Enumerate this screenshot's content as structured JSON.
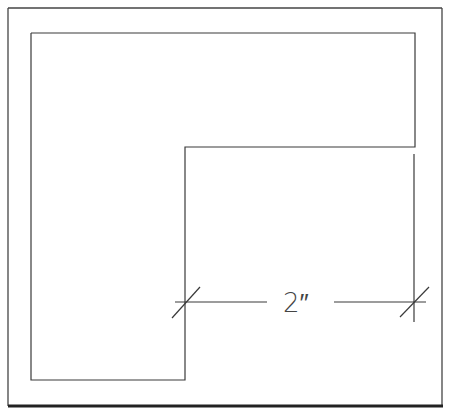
{
  "drawing": {
    "type": "CAD dimension drawing",
    "shape": "L-shaped outline",
    "dimension_label": "2″",
    "dimension_units": "inches",
    "line_color": "#3a3a3a",
    "background": "#ffffff"
  }
}
